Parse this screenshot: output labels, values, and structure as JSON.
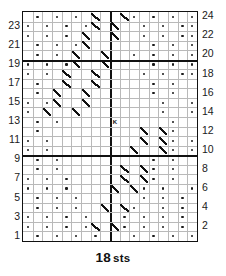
{
  "chart": {
    "title_caption_number": "18",
    "title_caption_unit": "sts",
    "stitch_count": 18,
    "row_count": 24,
    "left_row_numbers": [
      "23",
      "21",
      "19",
      "17",
      "15",
      "13",
      "11",
      "9",
      "7",
      "5",
      "3",
      "1"
    ],
    "right_row_numbers": [
      "24",
      "22",
      "20",
      "18",
      "16",
      "14",
      "12",
      "10",
      "8",
      "6",
      "4",
      "2"
    ],
    "center_marker_label": "K",
    "colors": {
      "grid_line": "#b9b9b9",
      "heavy_line": "#111111",
      "symbol": "#1a1a1a",
      "background": "#ffffff"
    }
  },
  "chart_data": {
    "type": "heatmap",
    "xlabel": "18 sts",
    "ylabel": "",
    "grid": true,
    "legend": "none",
    "columns": 18,
    "rows": 24,
    "x": [
      1,
      2,
      3,
      4,
      5,
      6,
      7,
      8,
      9,
      10,
      11,
      12,
      13,
      14,
      15,
      16,
      17,
      18
    ],
    "row_labels_left": [
      "23",
      "21",
      "19",
      "17",
      "15",
      "13",
      "11",
      "9",
      "7",
      "5",
      "3",
      "1"
    ],
    "row_labels_right": [
      "24",
      "22",
      "20",
      "18",
      "16",
      "14",
      "12",
      "10",
      "8",
      "6",
      "4",
      "2"
    ],
    "heavy_horizontal_rules_above_rows": [
      10,
      20
    ],
    "heavy_vertical_rule_after_column": 9,
    "symbol_legend": {
      "dot": "purl stitch",
      "slash": "right-leaning twist / cable",
      "K": "knit marker"
    },
    "annotations": [
      {
        "row": 13,
        "col": 10,
        "symbol": "K",
        "label": "K"
      }
    ],
    "cells": [
      {
        "row": 24,
        "marks": [
          {
            "col": 2,
            "s": "dot"
          },
          {
            "col": 4,
            "s": "dot"
          },
          {
            "col": 6,
            "s": "dot"
          },
          {
            "col": 8,
            "s": "slash"
          },
          {
            "col": 11,
            "s": "slash"
          },
          {
            "col": 12,
            "s": "dot"
          },
          {
            "col": 14,
            "s": "dot"
          },
          {
            "col": 16,
            "s": "dot"
          },
          {
            "col": 18,
            "s": "dot"
          }
        ]
      },
      {
        "row": 23,
        "marks": [
          {
            "col": 1,
            "s": "dot"
          },
          {
            "col": 3,
            "s": "dot"
          },
          {
            "col": 5,
            "s": "dot"
          },
          {
            "col": 7,
            "s": "dot"
          },
          {
            "col": 8,
            "s": "slash"
          },
          {
            "col": 10,
            "s": "slash"
          },
          {
            "col": 13,
            "s": "dot"
          },
          {
            "col": 15,
            "s": "dot"
          },
          {
            "col": 17,
            "s": "dot"
          },
          {
            "col": 18,
            "s": "dot"
          }
        ]
      },
      {
        "row": 22,
        "marks": [
          {
            "col": 1,
            "s": "dot"
          },
          {
            "col": 3,
            "s": "dot"
          },
          {
            "col": 5,
            "s": "dot"
          },
          {
            "col": 7,
            "s": "slash"
          },
          {
            "col": 10,
            "s": "slash"
          },
          {
            "col": 13,
            "s": "dot"
          },
          {
            "col": 15,
            "s": "dot"
          },
          {
            "col": 17,
            "s": "dot"
          },
          {
            "col": 18,
            "s": "dot"
          }
        ]
      },
      {
        "row": 21,
        "marks": [
          {
            "col": 2,
            "s": "dot"
          },
          {
            "col": 4,
            "s": "dot"
          },
          {
            "col": 6,
            "s": "dot"
          },
          {
            "col": 7,
            "s": "slash"
          },
          {
            "col": 14,
            "s": "dot"
          },
          {
            "col": 16,
            "s": "dot"
          },
          {
            "col": 18,
            "s": "dot"
          }
        ]
      },
      {
        "row": 20,
        "marks": [
          {
            "col": 2,
            "s": "dot"
          },
          {
            "col": 4,
            "s": "dot"
          },
          {
            "col": 6,
            "s": "slash"
          },
          {
            "col": 9,
            "s": "slash"
          },
          {
            "col": 12,
            "s": "dot"
          },
          {
            "col": 14,
            "s": "dot"
          },
          {
            "col": 16,
            "s": "dot"
          },
          {
            "col": 18,
            "s": "dot"
          }
        ]
      },
      {
        "row": 19,
        "marks": [
          {
            "col": 1,
            "s": "dot"
          },
          {
            "col": 3,
            "s": "dot"
          },
          {
            "col": 5,
            "s": "dot"
          },
          {
            "col": 6,
            "s": "slash"
          },
          {
            "col": 9,
            "s": "slash"
          },
          {
            "col": 14,
            "s": "dot"
          },
          {
            "col": 16,
            "s": "dot"
          },
          {
            "col": 18,
            "s": "dot"
          }
        ]
      },
      {
        "row": 18,
        "marks": [
          {
            "col": 1,
            "s": "dot"
          },
          {
            "col": 3,
            "s": "dot"
          },
          {
            "col": 5,
            "s": "slash"
          },
          {
            "col": 8,
            "s": "slash"
          },
          {
            "col": 13,
            "s": "dot"
          },
          {
            "col": 15,
            "s": "dot"
          },
          {
            "col": 17,
            "s": "dot"
          },
          {
            "col": 18,
            "s": "dot"
          }
        ]
      },
      {
        "row": 17,
        "marks": [
          {
            "col": 2,
            "s": "dot"
          },
          {
            "col": 5,
            "s": "slash"
          },
          {
            "col": 8,
            "s": "slash"
          },
          {
            "col": 14,
            "s": "dot"
          },
          {
            "col": 16,
            "s": "dot"
          }
        ]
      },
      {
        "row": 16,
        "marks": [
          {
            "col": 2,
            "s": "dot"
          },
          {
            "col": 4,
            "s": "slash"
          },
          {
            "col": 7,
            "s": "slash"
          },
          {
            "col": 14,
            "s": "dot"
          },
          {
            "col": 16,
            "s": "dot"
          }
        ]
      },
      {
        "row": 15,
        "marks": [
          {
            "col": 1,
            "s": "dot"
          },
          {
            "col": 3,
            "s": "dot"
          },
          {
            "col": 4,
            "s": "slash"
          },
          {
            "col": 7,
            "s": "slash"
          },
          {
            "col": 15,
            "s": "dot"
          },
          {
            "col": 18,
            "s": "dot"
          }
        ]
      },
      {
        "row": 14,
        "marks": [
          {
            "col": 1,
            "s": "dot"
          },
          {
            "col": 3,
            "s": "slash"
          },
          {
            "col": 6,
            "s": "slash"
          },
          {
            "col": 15,
            "s": "dot"
          },
          {
            "col": 18,
            "s": "dot"
          }
        ]
      },
      {
        "row": 13,
        "marks": [
          {
            "col": 2,
            "s": "dot"
          },
          {
            "col": 4,
            "s": "dot"
          },
          {
            "col": 10,
            "s": "K"
          },
          {
            "col": 16,
            "s": "dot"
          }
        ]
      },
      {
        "row": 12,
        "marks": [
          {
            "col": 2,
            "s": "dot"
          },
          {
            "col": 13,
            "s": "slash"
          },
          {
            "col": 15,
            "s": "slash"
          },
          {
            "col": 16,
            "s": "dot"
          }
        ]
      },
      {
        "row": 11,
        "marks": [
          {
            "col": 1,
            "s": "dot"
          },
          {
            "col": 3,
            "s": "dot"
          },
          {
            "col": 13,
            "s": "slash"
          },
          {
            "col": 15,
            "s": "slash"
          },
          {
            "col": 16,
            "s": "dot"
          },
          {
            "col": 18,
            "s": "dot"
          }
        ]
      },
      {
        "row": 10,
        "marks": [
          {
            "col": 1,
            "s": "dot"
          },
          {
            "col": 3,
            "s": "dot"
          },
          {
            "col": 12,
            "s": "slash"
          },
          {
            "col": 15,
            "s": "slash"
          },
          {
            "col": 16,
            "s": "dot"
          },
          {
            "col": 18,
            "s": "dot"
          }
        ]
      },
      {
        "row": 9,
        "marks": [
          {
            "col": 2,
            "s": "dot"
          },
          {
            "col": 4,
            "s": "dot"
          },
          {
            "col": 14,
            "s": "dot"
          },
          {
            "col": 16,
            "s": "dot"
          }
        ]
      },
      {
        "row": 8,
        "marks": [
          {
            "col": 2,
            "s": "dot"
          },
          {
            "col": 4,
            "s": "dot"
          },
          {
            "col": 11,
            "s": "slash"
          },
          {
            "col": 13,
            "s": "slash"
          },
          {
            "col": 14,
            "s": "dot"
          },
          {
            "col": 16,
            "s": "dot"
          }
        ]
      },
      {
        "row": 7,
        "marks": [
          {
            "col": 1,
            "s": "dot"
          },
          {
            "col": 3,
            "s": "dot"
          },
          {
            "col": 5,
            "s": "dot"
          },
          {
            "col": 11,
            "s": "slash"
          },
          {
            "col": 13,
            "s": "slash"
          },
          {
            "col": 14,
            "s": "dot"
          },
          {
            "col": 16,
            "s": "dot"
          }
        ]
      },
      {
        "row": 6,
        "marks": [
          {
            "col": 1,
            "s": "dot"
          },
          {
            "col": 3,
            "s": "dot"
          },
          {
            "col": 5,
            "s": "dot"
          },
          {
            "col": 10,
            "s": "slash"
          },
          {
            "col": 12,
            "s": "slash"
          },
          {
            "col": 13,
            "s": "dot"
          },
          {
            "col": 15,
            "s": "dot"
          },
          {
            "col": 18,
            "s": "dot"
          }
        ]
      },
      {
        "row": 5,
        "marks": [
          {
            "col": 2,
            "s": "dot"
          },
          {
            "col": 4,
            "s": "dot"
          },
          {
            "col": 6,
            "s": "dot"
          },
          {
            "col": 13,
            "s": "dot"
          },
          {
            "col": 15,
            "s": "dot"
          },
          {
            "col": 17,
            "s": "dot"
          }
        ]
      },
      {
        "row": 4,
        "marks": [
          {
            "col": 2,
            "s": "dot"
          },
          {
            "col": 4,
            "s": "dot"
          },
          {
            "col": 6,
            "s": "dot"
          },
          {
            "col": 9,
            "s": "slash"
          },
          {
            "col": 11,
            "s": "slash"
          },
          {
            "col": 12,
            "s": "dot"
          },
          {
            "col": 15,
            "s": "dot"
          },
          {
            "col": 17,
            "s": "dot"
          }
        ]
      },
      {
        "row": 3,
        "marks": [
          {
            "col": 1,
            "s": "dot"
          },
          {
            "col": 3,
            "s": "dot"
          },
          {
            "col": 5,
            "s": "dot"
          },
          {
            "col": 7,
            "s": "dot"
          },
          {
            "col": 11,
            "s": "dot"
          },
          {
            "col": 13,
            "s": "dot"
          },
          {
            "col": 15,
            "s": "dot"
          },
          {
            "col": 17,
            "s": "dot"
          }
        ]
      },
      {
        "row": 2,
        "marks": [
          {
            "col": 1,
            "s": "dot"
          },
          {
            "col": 3,
            "s": "dot"
          },
          {
            "col": 5,
            "s": "dot"
          },
          {
            "col": 7,
            "s": "dot"
          },
          {
            "col": 8,
            "s": "slash"
          },
          {
            "col": 10,
            "s": "slash"
          },
          {
            "col": 11,
            "s": "dot"
          },
          {
            "col": 13,
            "s": "dot"
          },
          {
            "col": 15,
            "s": "dot"
          },
          {
            "col": 17,
            "s": "dot"
          }
        ]
      },
      {
        "row": 1,
        "marks": [
          {
            "col": 2,
            "s": "dot"
          },
          {
            "col": 4,
            "s": "dot"
          },
          {
            "col": 6,
            "s": "dot"
          },
          {
            "col": 8,
            "s": "dot"
          },
          {
            "col": 12,
            "s": "dot"
          },
          {
            "col": 14,
            "s": "dot"
          },
          {
            "col": 16,
            "s": "dot"
          },
          {
            "col": 18,
            "s": "dot"
          }
        ]
      }
    ]
  }
}
